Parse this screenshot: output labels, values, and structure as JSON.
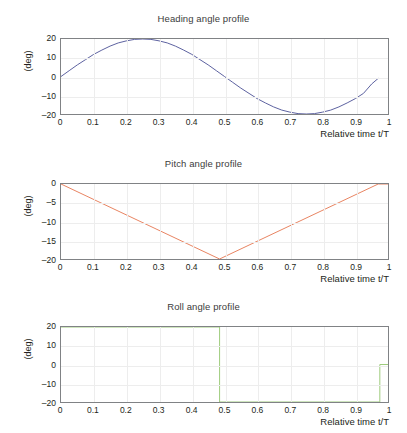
{
  "figure": {
    "width": 407,
    "height": 433,
    "background": "#ffffff"
  },
  "chart_data": [
    {
      "type": "line",
      "title": "Heading angle profile",
      "xlabel": "Relative time t/T",
      "ylabel": "(deg)",
      "xlim": [
        0,
        1
      ],
      "ylim": [
        -20,
        20
      ],
      "xticks": [
        "0",
        "0.1",
        "0.2",
        "0.3",
        "0.4",
        "0.5",
        "0.6",
        "0.7",
        "0.8",
        "0.9",
        "1"
      ],
      "xtick_values": [
        0,
        0.1,
        0.2,
        0.3,
        0.4,
        0.5,
        0.6,
        0.7,
        0.8,
        0.9,
        1
      ],
      "yticks": [
        "20",
        "10",
        "0",
        "-10",
        "-20"
      ],
      "ytick_values": [
        20,
        10,
        0,
        -10,
        -20
      ],
      "grid": true,
      "legend": "none",
      "color": "#5a5f9e",
      "series": [
        {
          "name": "heading angle",
          "x": [
            0.0,
            0.025,
            0.05,
            0.075,
            0.1,
            0.125,
            0.15,
            0.175,
            0.2,
            0.225,
            0.25,
            0.275,
            0.3,
            0.325,
            0.35,
            0.375,
            0.4,
            0.425,
            0.45,
            0.475,
            0.5,
            0.525,
            0.55,
            0.575,
            0.6,
            0.625,
            0.65,
            0.675,
            0.7,
            0.725,
            0.75,
            0.775,
            0.8,
            0.825,
            0.85,
            0.875,
            0.9,
            0.925,
            0.95,
            0.97
          ],
          "values": [
            0.0,
            3.1,
            6.2,
            9.0,
            11.8,
            14.1,
            16.2,
            17.9,
            19.0,
            19.8,
            20.0,
            19.8,
            19.0,
            17.9,
            16.2,
            14.1,
            11.8,
            9.0,
            6.2,
            3.1,
            0.0,
            -3.1,
            -6.2,
            -9.0,
            -11.8,
            -14.1,
            -16.2,
            -17.9,
            -19.0,
            -19.8,
            -20.0,
            -19.8,
            -19.0,
            -17.9,
            -16.2,
            -14.1,
            -11.8,
            -9.0,
            -4.0,
            -1.0
          ]
        }
      ]
    },
    {
      "type": "line",
      "title": "Pitch angle profile",
      "xlabel": "Relative time t/T",
      "ylabel": "(deg)",
      "xlim": [
        0,
        1
      ],
      "ylim": [
        -20,
        0
      ],
      "xticks": [
        "0",
        "0.1",
        "0.2",
        "0.3",
        "0.4",
        "0.5",
        "0.6",
        "0.7",
        "0.8",
        "0.9",
        "1"
      ],
      "xtick_values": [
        0,
        0.1,
        0.2,
        0.3,
        0.4,
        0.5,
        0.6,
        0.7,
        0.8,
        0.9,
        1
      ],
      "yticks": [
        "0",
        "-5",
        "-10",
        "-15",
        "-20"
      ],
      "ytick_values": [
        0,
        -5,
        -10,
        -15,
        -20
      ],
      "grid": true,
      "legend": "none",
      "color": "#e8825f",
      "series": [
        {
          "name": "pitch angle",
          "x": [
            0.0,
            0.485,
            0.97,
            1.0
          ],
          "values": [
            0.0,
            -20.0,
            0.0,
            0.0
          ]
        }
      ]
    },
    {
      "type": "line",
      "title": "Roll angle profile",
      "xlabel": "Relative time t/T",
      "ylabel": "(deg)",
      "xlim": [
        0,
        1
      ],
      "ylim": [
        -20,
        20
      ],
      "xticks": [
        "0",
        "0.1",
        "0.2",
        "0.3",
        "0.4",
        "0.5",
        "0.6",
        "0.7",
        "0.8",
        "0.9",
        "1"
      ],
      "xtick_values": [
        0,
        0.1,
        0.2,
        0.3,
        0.4,
        0.5,
        0.6,
        0.7,
        0.8,
        0.9,
        1
      ],
      "yticks": [
        "20",
        "10",
        "0",
        "-10",
        "-20"
      ],
      "ytick_values": [
        20,
        10,
        0,
        -10,
        -20
      ],
      "grid": true,
      "legend": "none",
      "color": "#9ccb7a",
      "series": [
        {
          "name": "roll angle",
          "x": [
            0.0,
            0.485,
            0.485,
            0.975,
            0.975,
            1.0
          ],
          "values": [
            20.0,
            20.0,
            -20.0,
            -20.0,
            0.0,
            0.0
          ]
        }
      ]
    }
  ]
}
